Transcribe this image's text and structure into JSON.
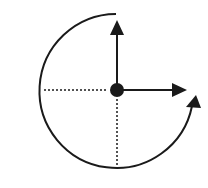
{
  "diagram": {
    "type": "rotation-axes",
    "colors": {
      "stroke": "#1a1a1a",
      "background": "#ffffff"
    },
    "center": {
      "x": 117,
      "y": 90,
      "dot_radius": 7
    },
    "arrows": [
      {
        "name": "up-arrow",
        "from": [
          117,
          90
        ],
        "to": [
          117,
          22
        ]
      },
      {
        "name": "right-arrow",
        "from": [
          117,
          90
        ],
        "to": [
          187,
          90
        ]
      }
    ],
    "dotted_lines": [
      {
        "name": "left-reference-line",
        "from": [
          44,
          90
        ],
        "to": [
          108,
          90
        ]
      },
      {
        "name": "down-reference-line",
        "from": [
          117,
          99
        ],
        "to": [
          117,
          165
        ]
      }
    ],
    "arc": {
      "name": "rotation-arc",
      "radius": 77,
      "start": [
        116,
        14
      ],
      "end": [
        192,
        106
      ],
      "direction": "counterclockwise"
    }
  }
}
